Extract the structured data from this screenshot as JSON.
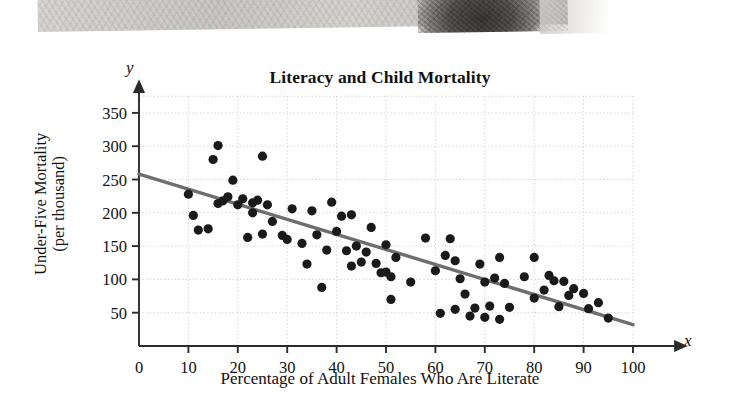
{
  "page": {
    "photo": {
      "caption_present": false,
      "description": "grayscale photograph fragment cropped at top of page"
    }
  },
  "chart_data": {
    "type": "scatter",
    "title": "Literacy and Child Mortality",
    "xlabel": "Percentage of Adult Females Who Are Literate",
    "ylabel": "Under-Five Mortality",
    "ylabel_line2": "(per thousand)",
    "x_axis_letter": "x",
    "y_axis_letter": "y",
    "xlim": [
      0,
      100
    ],
    "ylim": [
      0,
      375
    ],
    "xticks": [
      0,
      10,
      20,
      30,
      40,
      50,
      60,
      70,
      80,
      90,
      100
    ],
    "yticks": [
      50,
      100,
      150,
      200,
      250,
      300,
      350
    ],
    "grid": true,
    "grid_style": "dotted",
    "legend": "none",
    "point_color": "#1a1a1a",
    "line_color": "#6e6e6e",
    "grid_color": "#cfcfcf",
    "axis_color": "#2b2b2b",
    "trend_line": {
      "label": "least-squares regression line",
      "x_start": 0,
      "y_start": 258,
      "x_end": 100,
      "y_end": 32
    },
    "points": [
      [
        10,
        228
      ],
      [
        11,
        196
      ],
      [
        12,
        174
      ],
      [
        14,
        176
      ],
      [
        15,
        280
      ],
      [
        16,
        214
      ],
      [
        16,
        301
      ],
      [
        17,
        218
      ],
      [
        18,
        224
      ],
      [
        19,
        249
      ],
      [
        20,
        212
      ],
      [
        21,
        221
      ],
      [
        22,
        163
      ],
      [
        23,
        215
      ],
      [
        23,
        200
      ],
      [
        24,
        219
      ],
      [
        25,
        285
      ],
      [
        25,
        168
      ],
      [
        26,
        212
      ],
      [
        27,
        187
      ],
      [
        29,
        166
      ],
      [
        30,
        160
      ],
      [
        31,
        206
      ],
      [
        33,
        154
      ],
      [
        34,
        123
      ],
      [
        35,
        203
      ],
      [
        36,
        167
      ],
      [
        37,
        88
      ],
      [
        38,
        144
      ],
      [
        39,
        216
      ],
      [
        40,
        172
      ],
      [
        41,
        195
      ],
      [
        42,
        143
      ],
      [
        43,
        197
      ],
      [
        43,
        120
      ],
      [
        44,
        150
      ],
      [
        45,
        126
      ],
      [
        46,
        141
      ],
      [
        47,
        178
      ],
      [
        48,
        124
      ],
      [
        49,
        110
      ],
      [
        50,
        152
      ],
      [
        50,
        111
      ],
      [
        51,
        104
      ],
      [
        51,
        70
      ],
      [
        52,
        133
      ],
      [
        55,
        96
      ],
      [
        58,
        162
      ],
      [
        60,
        113
      ],
      [
        61,
        49
      ],
      [
        62,
        136
      ],
      [
        63,
        161
      ],
      [
        64,
        128
      ],
      [
        64,
        55
      ],
      [
        65,
        101
      ],
      [
        66,
        78
      ],
      [
        67,
        45
      ],
      [
        68,
        57
      ],
      [
        69,
        123
      ],
      [
        70,
        96
      ],
      [
        70,
        43
      ],
      [
        71,
        60
      ],
      [
        72,
        102
      ],
      [
        73,
        40
      ],
      [
        73,
        133
      ],
      [
        74,
        94
      ],
      [
        75,
        58
      ],
      [
        78,
        104
      ],
      [
        80,
        133
      ],
      [
        80,
        72
      ],
      [
        82,
        84
      ],
      [
        83,
        106
      ],
      [
        84,
        98
      ],
      [
        85,
        59
      ],
      [
        86,
        97
      ],
      [
        87,
        76
      ],
      [
        88,
        86
      ],
      [
        90,
        79
      ],
      [
        91,
        56
      ],
      [
        93,
        65
      ],
      [
        95,
        42
      ]
    ]
  }
}
